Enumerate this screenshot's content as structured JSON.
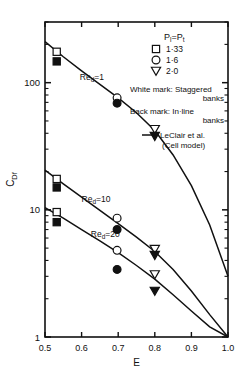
{
  "chart_data": {
    "type": "scatter",
    "title": "",
    "xlabel": "E",
    "ylabel": "C_Df",
    "ylabel_display": "CDf",
    "xlim": [
      0.5,
      1.0
    ],
    "ylim": [
      1,
      300
    ],
    "yscale": "log",
    "xscale": "linear",
    "grid": false,
    "xticks": [
      0.5,
      0.6,
      0.7,
      0.8,
      0.9,
      1.0
    ],
    "xtick_labels": [
      "0.5",
      "0.6",
      "0.7",
      "0.8",
      "0.9",
      "1.0"
    ],
    "yticks": [
      1,
      10,
      100
    ],
    "ytick_labels": [
      "1",
      "10",
      "100"
    ],
    "legend_position": "upper-right",
    "annotations": [
      {
        "text": "Red=1",
        "display": "Re",
        "sub": "d",
        "tail": "=1",
        "x": 0.595,
        "y": 105
      },
      {
        "text": "Red=10",
        "display": "Re",
        "sub": "d",
        "tail": "=10",
        "x": 0.6,
        "y": 11.5
      },
      {
        "text": "Red=20",
        "display": "Re",
        "sub": "d",
        "tail": "=20",
        "x": 0.625,
        "y": 6.1
      }
    ],
    "series": [
      {
        "name": "Red=1 staggered (white mark)",
        "reynolds": 1,
        "fill": "open",
        "points": [
          {
            "x": 0.532,
            "y": 175,
            "marker": "square",
            "pitch": 1.33
          },
          {
            "x": 0.697,
            "y": 76,
            "marker": "circle",
            "pitch": 1.6
          },
          {
            "x": 0.8,
            "y": 43,
            "marker": "triangle-down",
            "pitch": 2.0
          }
        ]
      },
      {
        "name": "Red=1 in-line (black mark)",
        "reynolds": 1,
        "fill": "filled",
        "points": [
          {
            "x": 0.532,
            "y": 147,
            "marker": "square",
            "pitch": 1.33
          },
          {
            "x": 0.697,
            "y": 69,
            "marker": "circle",
            "pitch": 1.6
          },
          {
            "x": 0.8,
            "y": 38,
            "marker": "triangle-down",
            "pitch": 2.0
          }
        ]
      },
      {
        "name": "Red=10 staggered (white mark)",
        "reynolds": 10,
        "fill": "open",
        "points": [
          {
            "x": 0.532,
            "y": 17.5,
            "marker": "square",
            "pitch": 1.33
          },
          {
            "x": 0.697,
            "y": 8.6,
            "marker": "circle",
            "pitch": 1.6
          },
          {
            "x": 0.8,
            "y": 4.9,
            "marker": "triangle-down",
            "pitch": 2.0
          }
        ]
      },
      {
        "name": "Red=10 in-line (black mark)",
        "reynolds": 10,
        "fill": "filled",
        "points": [
          {
            "x": 0.532,
            "y": 15.0,
            "marker": "square",
            "pitch": 1.33
          },
          {
            "x": 0.697,
            "y": 7.0,
            "marker": "circle",
            "pitch": 1.6
          },
          {
            "x": 0.8,
            "y": 4.4,
            "marker": "triangle-down",
            "pitch": 2.0
          }
        ]
      },
      {
        "name": "Red=20 staggered (white mark)",
        "reynolds": 20,
        "fill": "open",
        "points": [
          {
            "x": 0.532,
            "y": 9.6,
            "marker": "square",
            "pitch": 1.33
          },
          {
            "x": 0.697,
            "y": 4.8,
            "marker": "circle",
            "pitch": 1.6
          },
          {
            "x": 0.8,
            "y": 3.1,
            "marker": "triangle-down",
            "pitch": 2.0
          }
        ]
      },
      {
        "name": "Red=20 in-line (black mark)",
        "reynolds": 20,
        "fill": "filled",
        "points": [
          {
            "x": 0.532,
            "y": 8.0,
            "marker": "square",
            "pitch": 1.33
          },
          {
            "x": 0.697,
            "y": 3.4,
            "marker": "circle",
            "pitch": 1.6
          },
          {
            "x": 0.8,
            "y": 2.3,
            "marker": "triangle-down",
            "pitch": 2.0
          }
        ]
      }
    ],
    "curves": [
      {
        "name": "LeClair et al. cell model, Red=1",
        "reynolds": 1,
        "x": [
          0.5,
          0.55,
          0.6,
          0.65,
          0.7,
          0.75,
          0.8,
          0.85,
          0.9,
          0.95,
          1.0
        ],
        "y": [
          210,
          160,
          124,
          97,
          76,
          58,
          42,
          27,
          15.5,
          7.6,
          3.0
        ]
      },
      {
        "name": "LeClair et al. cell model, Red=10",
        "reynolds": 10,
        "x": [
          0.5,
          0.55,
          0.6,
          0.65,
          0.7,
          0.75,
          0.8,
          0.85,
          0.9,
          0.95,
          1.0
        ],
        "y": [
          20.5,
          16.0,
          12.6,
          9.9,
          7.8,
          6.1,
          4.7,
          3.4,
          2.3,
          1.5,
          1.0
        ]
      },
      {
        "name": "LeClair et al. cell model, Red=20",
        "reynolds": 20,
        "x": [
          0.5,
          0.55,
          0.6,
          0.65,
          0.7,
          0.75,
          0.8,
          0.85,
          0.9,
          0.95,
          1.0
        ],
        "y": [
          10.4,
          8.6,
          7.0,
          5.7,
          4.6,
          3.65,
          2.85,
          2.15,
          1.6,
          1.2,
          0.98
        ]
      }
    ],
    "legend": {
      "header": "Pₗ=Pₜ",
      "header_parts": {
        "p": "P",
        "sub_l": "l",
        "eq": "=",
        "p2": "P",
        "sub_t": "t"
      },
      "entries": [
        {
          "marker": "square",
          "label": "1·33"
        },
        {
          "marker": "circle",
          "label": "1·6"
        },
        {
          "marker": "triangle-down",
          "label": "2·0"
        }
      ],
      "notes": [
        {
          "line1": "White mark: Staggered",
          "line2": "banks"
        },
        {
          "line1": "Back mark: In·line",
          "line2": "banks"
        }
      ],
      "curve_entry": {
        "line1": "LeClair et al.",
        "line2": "(Cell model)"
      }
    },
    "colors": {
      "ink": "#111111",
      "background": "#ffffff",
      "marker_fill_open": "#ffffff",
      "marker_fill_solid": "#111111"
    }
  }
}
